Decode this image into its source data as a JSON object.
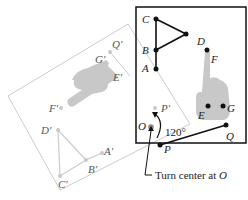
{
  "diagram": {
    "type": "rotation-transformation",
    "rotation_angle_label": "120°",
    "caption_prefix": "Turn center at ",
    "caption_center": "O",
    "center_label": "O",
    "original_points": {
      "A": "A",
      "B": "B",
      "C": "C",
      "D": "D",
      "E": "E",
      "F": "F",
      "G": "G",
      "P": "P",
      "Q": "Q"
    },
    "image_points": {
      "A": "A′",
      "B": "B′",
      "C": "C′",
      "D": "D′",
      "E": "E′",
      "F": "F′",
      "G": "G′",
      "P": "P′",
      "Q": "Q′"
    },
    "colors": {
      "original": "#111111",
      "image": "#c8c8c8",
      "frame_original": "#111111",
      "frame_image": "#cccccc",
      "hand_fill": "#c9c9c9",
      "center_point": "#888888"
    }
  }
}
